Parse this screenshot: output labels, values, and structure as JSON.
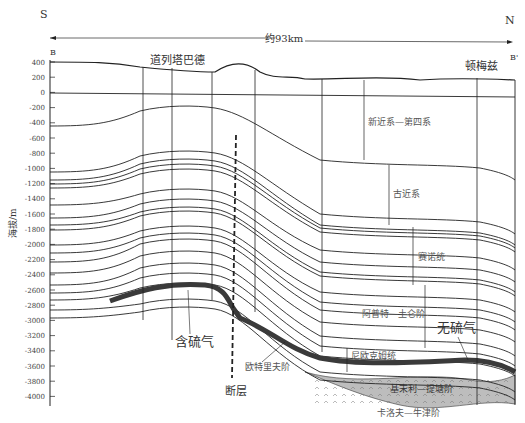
{
  "diagram": {
    "title_direction": {
      "left": "S",
      "right": "N",
      "distance": "约93km"
    },
    "endpoints": {
      "left": "B",
      "right": "B'"
    },
    "places": [
      {
        "name": "道列塔巴德",
        "x": 195
      },
      {
        "name": "顿梅兹",
        "x": 455
      }
    ],
    "y_axis": {
      "label": "海拔/m",
      "ticks": [
        "400",
        "200",
        "0",
        "-200",
        "-400",
        "-600",
        "-800",
        "-1000",
        "-1200",
        "-1400",
        "-1600",
        "-1800",
        "-2000",
        "-2200",
        "-2400",
        "-2600",
        "-2800",
        "-3000",
        "-3200",
        "-3400",
        "-3600",
        "-3800",
        "-4000"
      ]
    },
    "strata_labels": [
      "新近系—第四系",
      "古近系",
      "赛诺统",
      "阿普特—土仑阶",
      "尼欧克姆统",
      "欧特里夫阶",
      "基末利—提塘阶",
      "卡洛夫—牛津阶"
    ],
    "annotations": {
      "sour_gas": "含硫气",
      "sweet_gas": "无硫气",
      "fault": "断层"
    },
    "colors": {
      "gas_layer": "#3a3a3a",
      "salt_fill": "#bdbdbd",
      "lines": "#222222"
    }
  }
}
